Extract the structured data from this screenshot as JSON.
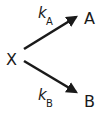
{
  "diagram": {
    "reactant": "X",
    "products": [
      {
        "label": "A",
        "rate_constant": "k",
        "subscript": "A"
      },
      {
        "label": "B",
        "rate_constant": "k",
        "subscript": "B"
      }
    ]
  },
  "colors": {
    "ink": "#1a1a1a",
    "background": "#ffffff"
  }
}
